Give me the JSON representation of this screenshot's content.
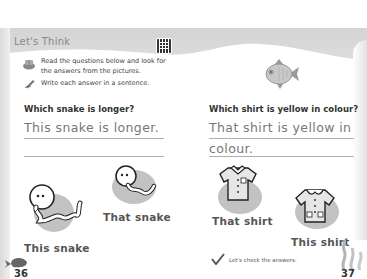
{
  "header": {
    "section_title": "Let's Think",
    "qr_icon": "qr-code-icon"
  },
  "instructions": [
    {
      "icon": "book-reading-icon",
      "text_line1": "Read the questions below and look for",
      "text_line2": "the answers from the pictures."
    },
    {
      "icon": "pencil-writing-icon",
      "text": "Write each answer in a sentence."
    }
  ],
  "left_page": {
    "question": "Which snake is longer?",
    "answer_line1": "This snake is longer.",
    "answer_line2": "",
    "images": [
      {
        "icon": "long-snake-icon",
        "caption": "This snake"
      },
      {
        "icon": "short-snake-icon",
        "caption": "That snake"
      }
    ],
    "page_number": "36",
    "corner_icon": "whale-icon"
  },
  "right_page": {
    "question": "Which shirt is yellow in colour?",
    "answer_line1": "That shirt is yellow in",
    "answer_line2": "colour.",
    "images": [
      {
        "icon": "shirt-with-collar-icon",
        "caption": "That shirt"
      },
      {
        "icon": "blouse-with-pockets-icon",
        "caption": "This shirt"
      }
    ],
    "check_text": "Let's check the answers.",
    "page_number": "37",
    "corner_icon": "seaweed-icon",
    "decor_icon": "fish-icon"
  }
}
